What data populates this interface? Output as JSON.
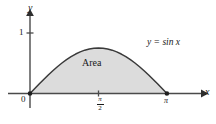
{
  "figure": {
    "background_color": "#ffffff",
    "axis_color": "#4a4a4a",
    "curve_color": "#3a3a3a",
    "fill_color": "#dcdcdc",
    "text_color": "#1a1a1a"
  },
  "labels": {
    "y_axis": "y",
    "x_axis": "x",
    "y_tick_one": "1",
    "origin": "0",
    "x_tick_pi": "π",
    "x_tick_pi_half_numerator": "π",
    "x_tick_pi_half_denominator": "2",
    "equation": "y = sin x",
    "region": "Area"
  },
  "chart_data": {
    "type": "line",
    "title": "",
    "xlabel": "x",
    "ylabel": "y",
    "legend": [
      "y = sin x"
    ],
    "grid": false,
    "xlim": [
      0,
      3.5
    ],
    "ylim": [
      0,
      1.15
    ],
    "xticks": [
      0,
      1.5707963,
      3.1415927
    ],
    "xticklabels": [
      "0",
      "π/2",
      "π"
    ],
    "yticks": [
      1
    ],
    "yticklabels": [
      "1"
    ],
    "annotations": [
      {
        "text": "Area",
        "x": 1.5707963,
        "y": 0.45
      },
      {
        "text": "y = sin x",
        "x": 2.6,
        "y": 0.85
      }
    ],
    "markers": [
      {
        "x": 0,
        "y": 0
      },
      {
        "x": 3.1415927,
        "y": 0
      }
    ],
    "series": [
      {
        "name": "y = sin x",
        "filled": true,
        "x": [
          0.0,
          0.10472,
          0.20944,
          0.31416,
          0.41888,
          0.5236,
          0.62832,
          0.73304,
          0.83776,
          0.94248,
          1.0472,
          1.15192,
          1.25664,
          1.36136,
          1.46608,
          1.5708,
          1.67552,
          1.78024,
          1.88496,
          1.98968,
          2.0944,
          2.19912,
          2.30383,
          2.40855,
          2.51327,
          2.61799,
          2.72271,
          2.82743,
          2.93215,
          3.03687,
          3.14159
        ],
        "y": [
          0.0,
          0.10453,
          0.20791,
          0.30902,
          0.40674,
          0.5,
          0.58779,
          0.66913,
          0.74314,
          0.80902,
          0.86603,
          0.91355,
          0.95106,
          0.97815,
          0.99452,
          1.0,
          0.99452,
          0.97815,
          0.95106,
          0.91355,
          0.86603,
          0.80902,
          0.74314,
          0.66913,
          0.58779,
          0.5,
          0.40674,
          0.30902,
          0.20791,
          0.10453,
          0.0
        ]
      }
    ]
  }
}
